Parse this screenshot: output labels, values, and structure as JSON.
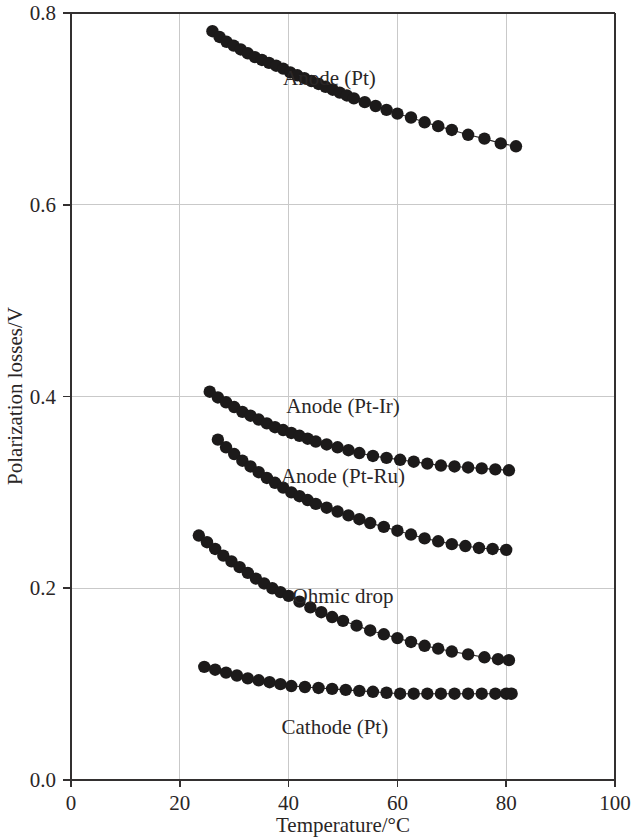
{
  "chart_data": {
    "type": "scatter",
    "title": "",
    "xlabel": "Temperature/°C",
    "ylabel": "Polarization losses/V",
    "xlim": [
      0,
      100
    ],
    "ylim": [
      0.0,
      0.8
    ],
    "xticks": [
      0,
      20,
      40,
      60,
      80,
      100
    ],
    "xtick_labels": [
      "0",
      "20",
      "40",
      "60",
      "80",
      "100"
    ],
    "yticks": [
      0.0,
      0.2,
      0.4,
      0.6,
      0.8
    ],
    "ytick_labels": [
      "0.0",
      "0.2",
      "0.4",
      "0.6",
      "0.8"
    ],
    "grid": true,
    "legend": "inline-annotations",
    "marker": "filled-circle",
    "series": [
      {
        "name": "Anode (Pt)",
        "label_x": 47.5,
        "label_y": 0.725,
        "x": [
          26.0,
          27.3,
          28.6,
          29.9,
          31.2,
          32.5,
          33.8,
          35.1,
          36.4,
          37.7,
          39.0,
          40.3,
          41.6,
          42.9,
          44.2,
          45.5,
          46.8,
          48.1,
          49.4,
          50.7,
          52.0,
          54.0,
          56.0,
          58.0,
          60.0,
          62.5,
          65.0,
          67.5,
          70.0,
          73.0,
          76.0,
          79.0,
          81.8
        ],
        "y": [
          0.781,
          0.775,
          0.77,
          0.766,
          0.762,
          0.758,
          0.754,
          0.751,
          0.748,
          0.745,
          0.742,
          0.738,
          0.735,
          0.732,
          0.729,
          0.726,
          0.723,
          0.72,
          0.717,
          0.714,
          0.711,
          0.707,
          0.703,
          0.699,
          0.695,
          0.691,
          0.686,
          0.682,
          0.678,
          0.673,
          0.669,
          0.664,
          0.661
        ]
      },
      {
        "name": "Anode (Pt-Ir)",
        "label_x": 50.0,
        "label_y": 0.383,
        "x": [
          25.5,
          27.0,
          28.5,
          30.0,
          31.5,
          33.0,
          34.5,
          36.0,
          37.5,
          39.0,
          40.5,
          42.0,
          43.5,
          45.0,
          47.0,
          49.0,
          51.0,
          53.0,
          55.5,
          58.0,
          60.5,
          63.0,
          65.5,
          68.0,
          70.5,
          73.0,
          75.5,
          78.0,
          80.5
        ],
        "y": [
          0.405,
          0.399,
          0.394,
          0.389,
          0.384,
          0.38,
          0.376,
          0.372,
          0.368,
          0.365,
          0.362,
          0.359,
          0.356,
          0.353,
          0.35,
          0.347,
          0.344,
          0.341,
          0.338,
          0.336,
          0.334,
          0.332,
          0.33,
          0.328,
          0.327,
          0.326,
          0.325,
          0.324,
          0.323
        ]
      },
      {
        "name": "Anode (Pt-Ru)",
        "label_x": 50.0,
        "label_y": 0.31,
        "x": [
          27.0,
          28.5,
          30.0,
          31.5,
          33.0,
          34.5,
          36.0,
          37.5,
          39.0,
          40.5,
          42.0,
          43.5,
          45.0,
          47.0,
          49.0,
          51.0,
          53.0,
          55.0,
          57.5,
          60.0,
          62.5,
          65.0,
          67.5,
          70.0,
          72.5,
          75.0,
          77.5,
          80.0
        ],
        "y": [
          0.355,
          0.347,
          0.34,
          0.333,
          0.327,
          0.321,
          0.315,
          0.31,
          0.305,
          0.3,
          0.296,
          0.292,
          0.288,
          0.284,
          0.28,
          0.276,
          0.272,
          0.268,
          0.264,
          0.26,
          0.256,
          0.252,
          0.249,
          0.246,
          0.244,
          0.242,
          0.241,
          0.24
        ]
      },
      {
        "name": "Ohmic drop",
        "label_x": 50.0,
        "label_y": 0.185,
        "x": [
          23.5,
          25.0,
          26.5,
          28.0,
          29.5,
          31.0,
          32.5,
          34.0,
          35.5,
          37.0,
          38.5,
          40.0,
          42.0,
          44.0,
          46.0,
          48.0,
          50.0,
          52.5,
          55.0,
          57.5,
          60.0,
          62.5,
          65.0,
          67.5,
          70.0,
          73.0,
          76.0,
          78.5,
          80.5
        ],
        "y": [
          0.255,
          0.248,
          0.241,
          0.234,
          0.228,
          0.222,
          0.216,
          0.21,
          0.205,
          0.2,
          0.196,
          0.192,
          0.186,
          0.18,
          0.175,
          0.17,
          0.166,
          0.161,
          0.156,
          0.152,
          0.148,
          0.144,
          0.14,
          0.137,
          0.134,
          0.131,
          0.128,
          0.126,
          0.125
        ]
      },
      {
        "name": "Cathode (Pt)",
        "label_x": 48.5,
        "label_y": 0.048,
        "x": [
          24.5,
          26.5,
          28.5,
          30.5,
          32.5,
          34.5,
          36.5,
          38.5,
          40.5,
          43.0,
          45.5,
          48.0,
          50.5,
          53.0,
          55.5,
          58.0,
          60.5,
          63.0,
          65.5,
          68.0,
          70.5,
          73.0,
          75.5,
          78.0,
          80.0,
          81.0
        ],
        "y": [
          0.118,
          0.115,
          0.112,
          0.109,
          0.106,
          0.104,
          0.102,
          0.1,
          0.098,
          0.097,
          0.096,
          0.095,
          0.094,
          0.093,
          0.092,
          0.091,
          0.09,
          0.09,
          0.09,
          0.09,
          0.09,
          0.09,
          0.09,
          0.09,
          0.09,
          0.09
        ]
      }
    ]
  },
  "colors": {
    "marker": "#1c1a1a",
    "line": "#2b2828",
    "grid": "#c9c9c9",
    "frame": "#333030",
    "background": "#ffffff"
  }
}
